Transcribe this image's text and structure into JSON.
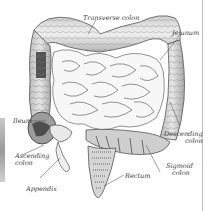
{
  "figure": {
    "labels": [
      {
        "id": "transverse-colon",
        "text": "Transverse colon"
      },
      {
        "id": "jejunum",
        "text": "Jejunum"
      },
      {
        "id": "ileum",
        "text": "Ileum"
      },
      {
        "id": "descending-colon",
        "line1": "Descending",
        "line2": "colon"
      },
      {
        "id": "ascending-colon",
        "line1": "Ascending",
        "line2": "colon"
      },
      {
        "id": "sigmoid-colon",
        "line1": "Sigmoid",
        "line2": "colon"
      },
      {
        "id": "rectum",
        "text": "Rectum"
      },
      {
        "id": "appendix",
        "text": "Appendix"
      }
    ]
  },
  "colors": {
    "ink": "#3a3a3a",
    "shade_dark": "#2b2b2b",
    "shade_mid": "#8a8a8a",
    "fill_light": "#f2f2f2",
    "background": "#ffffff"
  }
}
